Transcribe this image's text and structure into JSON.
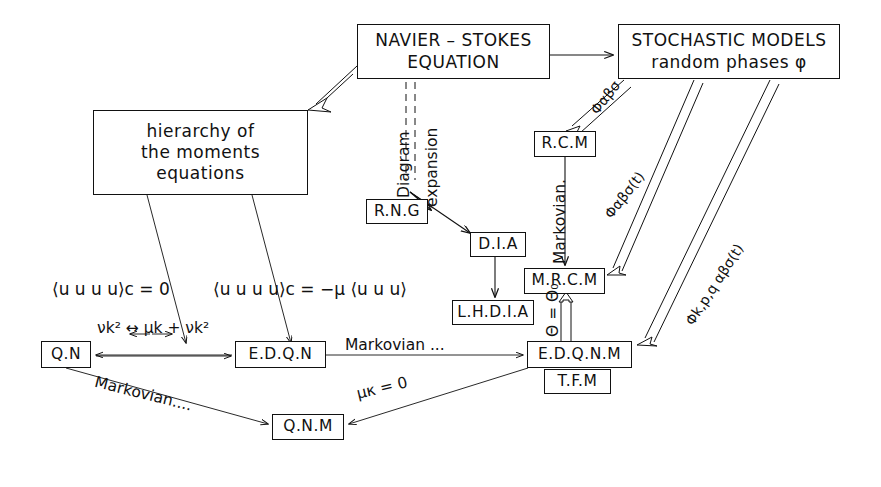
{
  "diagram": {
    "title_present": false,
    "background": "#ffffff",
    "stroke": "#111111",
    "boxes": [
      {
        "id": "navier-stokes",
        "label_lines": [
          "NAVIER – STOKES",
          "EQUATION"
        ],
        "x": 357,
        "y": 24,
        "w": 193,
        "h": 55,
        "size": "big"
      },
      {
        "id": "stochastic-models",
        "label_lines": [
          "STOCHASTIC MODELS",
          "random  phases φ"
        ],
        "x": 618,
        "y": 24,
        "w": 222,
        "h": 55,
        "size": "big"
      },
      {
        "id": "hierarchy-moments",
        "label_lines": [
          "hierarchy of",
          "the moments",
          "equations"
        ],
        "x": 93,
        "y": 110,
        "w": 215,
        "h": 85,
        "size": "big"
      },
      {
        "id": "rcm",
        "label_lines": [
          "R.C.M"
        ],
        "x": 534,
        "y": 131,
        "w": 62,
        "h": 26,
        "size": "med"
      },
      {
        "id": "rng",
        "label_lines": [
          "R.N.G"
        ],
        "x": 366,
        "y": 199,
        "w": 62,
        "h": 25,
        "size": "med"
      },
      {
        "id": "dia",
        "label_lines": [
          "D.I.A"
        ],
        "x": 470,
        "y": 232,
        "w": 56,
        "h": 25,
        "size": "med"
      },
      {
        "id": "mrcm",
        "label_lines": [
          "M.R.C.M"
        ],
        "x": 524,
        "y": 268,
        "w": 81,
        "h": 26,
        "size": "med"
      },
      {
        "id": "lhdia",
        "label_lines": [
          "L.H.D.I.A"
        ],
        "x": 452,
        "y": 300,
        "w": 82,
        "h": 25,
        "size": "med"
      },
      {
        "id": "qn",
        "label_lines": [
          "Q.N"
        ],
        "x": 41,
        "y": 341,
        "w": 50,
        "h": 27,
        "size": "med"
      },
      {
        "id": "edqn",
        "label_lines": [
          "E.D.Q.N"
        ],
        "x": 235,
        "y": 341,
        "w": 91,
        "h": 27,
        "size": "med"
      },
      {
        "id": "edqnm",
        "label_lines": [
          "E.D.Q.N.M"
        ],
        "x": 527,
        "y": 341,
        "w": 105,
        "h": 27,
        "size": "med"
      },
      {
        "id": "tfm",
        "label_lines": [
          "T.F.M"
        ],
        "x": 544,
        "y": 369,
        "w": 67,
        "h": 25,
        "size": "med"
      },
      {
        "id": "qnm",
        "label_lines": [
          "Q.N.M"
        ],
        "x": 272,
        "y": 414,
        "w": 72,
        "h": 26,
        "size": "med"
      }
    ],
    "labels": [
      {
        "id": "diagram-word",
        "text": "Diagram",
        "x": 396,
        "y": 198,
        "rot": -90,
        "size": "med"
      },
      {
        "id": "expansion-word",
        "text": "expansion",
        "x": 424,
        "y": 207,
        "rot": -90,
        "size": "med"
      },
      {
        "id": "markovian-vert",
        "text": "Markovian.",
        "x": 552,
        "y": 264,
        "rot": -90,
        "size": "med"
      },
      {
        "id": "theta-eq-theta0",
        "text": "Θ = Θ₀",
        "x": 545,
        "y": 337,
        "rot": -90,
        "size": "med"
      },
      {
        "id": "phi-abs",
        "text": "Φαβσ",
        "x": 588,
        "y": 108,
        "rot": -52,
        "size": "sm"
      },
      {
        "id": "phi-abs-t",
        "text": "Φαβσ(t)",
        "x": 602,
        "y": 212,
        "rot": -52,
        "size": "sm"
      },
      {
        "id": "phi-kpq-abs-t",
        "text": "Φk,p,q αβσ(t)",
        "x": 683,
        "y": 320,
        "rot": -57,
        "size": "sm"
      },
      {
        "id": "cumulant-zero",
        "text": "⟨u u u u⟩c = 0",
        "x": 52,
        "y": 280,
        "rot": 0,
        "size": "big"
      },
      {
        "id": "cumulant-mu",
        "text": "⟨u u u u⟩c = −μ ⟨u u u⟩",
        "x": 213,
        "y": 280,
        "rot": 0,
        "size": "big"
      },
      {
        "id": "nuk2-muk-nuk2",
        "text": "νk² ↔ μk + νk²",
        "x": 97,
        "y": 333,
        "rot": 0,
        "size": "med"
      },
      {
        "id": "markovian-mid",
        "text": "Markovian ...",
        "x": 345,
        "y": 337,
        "rot": 0,
        "size": "med"
      },
      {
        "id": "markovian-low",
        "text": "Markovian....",
        "x": 97,
        "y": 374,
        "rot": 14,
        "size": "med"
      },
      {
        "id": "mu-k-zero",
        "text": "μκ = 0",
        "x": 355,
        "y": 386,
        "rot": -13,
        "size": "med"
      }
    ]
  }
}
